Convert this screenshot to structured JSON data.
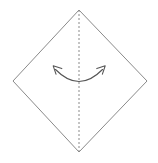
{
  "canvas": {
    "width": 158,
    "height": 163,
    "background": "#ffffff"
  },
  "diagram": {
    "type": "origami-fold-instruction",
    "shape": {
      "name": "square-rotated-45-diamond",
      "stroke_color": "#8a8a8a",
      "stroke_width": 1,
      "fill": "#ffffff",
      "vertices": [
        {
          "name": "top",
          "x": 79,
          "y": 10
        },
        {
          "name": "right",
          "x": 147,
          "y": 81
        },
        {
          "name": "bottom",
          "x": 79,
          "y": 152
        },
        {
          "name": "left",
          "x": 13,
          "y": 81
        }
      ],
      "points_path": "79,10 147,81 79,152 13,81"
    },
    "fold_line": {
      "name": "vertical-valley-fold-crease",
      "style": "dashed",
      "stroke_color": "#8a8a8a",
      "stroke_width": 1,
      "dash_pattern": "2 2",
      "x1": 79,
      "y1": 10,
      "x2": 79,
      "y2": 152
    },
    "arrow": {
      "name": "double-headed-fold-arrow",
      "direction": "both",
      "curvature": "bows-downward",
      "stroke_color": "#555555",
      "stroke_width": 1.1,
      "path": "M 55.5 69.5 Q 79 93.5 102.5 69.5",
      "heads": [
        {
          "name": "left-arrowhead",
          "points_up_left": true,
          "tip_x": 53,
          "tip_y": 66,
          "path": "M 61.5 68.5 L 53.2 65.8 L 55.8 73.8"
        },
        {
          "name": "right-arrowhead",
          "points_up_right": true,
          "tip_x": 105,
          "tip_y": 66,
          "path": "M 97.0 68.5 L 105.0 65.8 L 102.4 73.8"
        }
      ]
    }
  }
}
